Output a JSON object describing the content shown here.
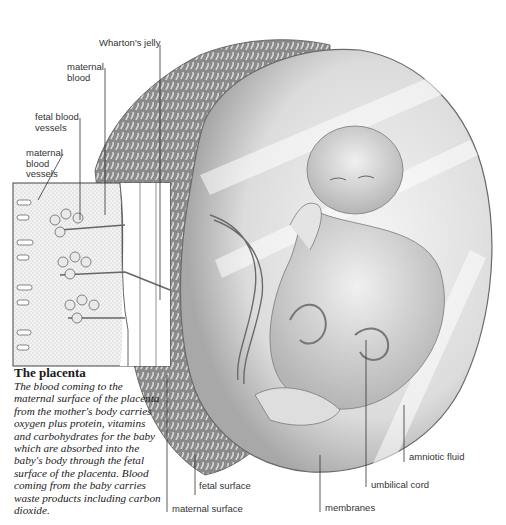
{
  "figure": {
    "title": "The placenta",
    "caption": "The blood coming to the maternal surface of the placenta from the mother's body carries oxygen plus protein, vitamins and carbohydrates for the baby which are absorbed into the baby's body through the fetal surface of the placenta. Blood coming from the baby carries waste products including carbon dioxide.",
    "labels": {
      "whartons_jelly": "Wharton's jelly",
      "maternal_blood": "maternal\nblood",
      "fetal_blood_vessels": "fetal blood\nvessels",
      "maternal_blood_vessels": "maternal\nblood\nvessels",
      "fetal_surface": "fetal surface",
      "maternal_surface": "maternal surface",
      "membranes": "membranes",
      "umbilical_cord": "umbilical cord",
      "amniotic_fluid": "amniotic fluid"
    },
    "colors": {
      "background": "#ffffff",
      "ink": "#2a2a2a",
      "shading": "#9a9a9a",
      "sac": "#e6e6e6"
    }
  }
}
